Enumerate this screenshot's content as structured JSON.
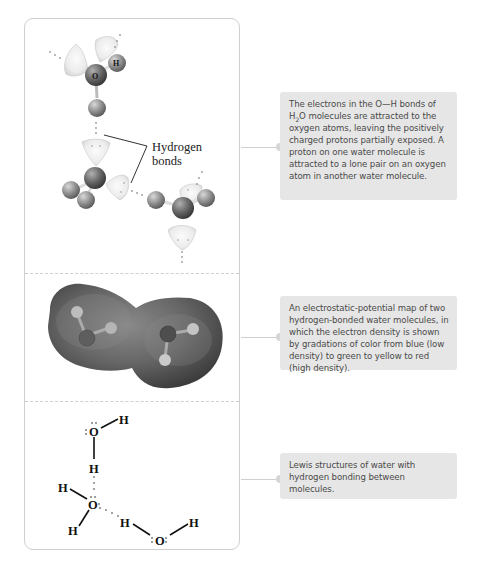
{
  "panels": [
    {
      "id": "ball-and-stick",
      "label": {
        "line1": "Hydrogen",
        "line2": "bonds"
      },
      "atom_labels": {
        "oxygen": "O",
        "hydrogen": "H"
      },
      "callout": {
        "text_before_sub": "The electrons in the O—H bonds of H",
        "subscript": "2",
        "text_after_sub": "O molecules are attracted to the oxygen atoms, leaving the positively charged protons partially exposed. A proton on one water molecule is attracted to a lone pair on an oxygen atom in another water molecule."
      }
    },
    {
      "id": "electrostatic-potential-map",
      "callout": {
        "text": "An electrostatic-potential map of two hydrogen-bonded water molecules, in which the electron density is shown by gradations of color from blue (low density) to green to yellow to red (high density)."
      }
    },
    {
      "id": "lewis-structures",
      "atoms": {
        "o": "O",
        "h": "H"
      },
      "callout": {
        "text": "Lewis structures of water with hydrogen bonding between molecules."
      }
    }
  ],
  "colors": {
    "frame_border": "#cfcfcf",
    "callout_bg": "#e6e6e6",
    "callout_text": "#4a4a4a",
    "lone_pair_lobe": "#ededed",
    "oxygen_atom": "#6e6e6e",
    "hydrogen_atom": "#9a9a9a",
    "epm_surface": "#5a5a5a"
  }
}
